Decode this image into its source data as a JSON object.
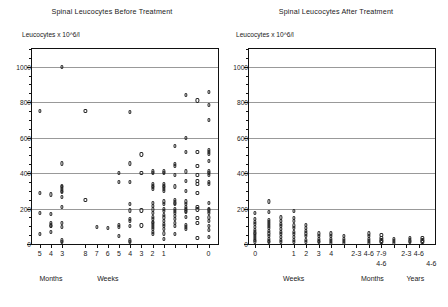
{
  "figure": {
    "panels": [
      {
        "id": "before",
        "title": "Spinal Leucocytes Before Treatment",
        "ylabel": "Leucocytes x 10^6/l",
        "xgroups": [
          {
            "label": "Months",
            "center_value": 4
          },
          {
            "label": "Weeks",
            "center_value": 6.5
          }
        ]
      },
      {
        "id": "after",
        "title": "Spinal Leucocytes After Treatment",
        "ylabel": "Leucocytes x 10^6/l",
        "xgroups": [
          {
            "label": "Weeks",
            "center_value": 2
          },
          {
            "label": "Months",
            "center_value": 6.5
          },
          {
            "label": "Years",
            "center_value": 9.0
          }
        ]
      }
    ]
  },
  "chart_data": [
    {
      "type": "scatter",
      "title": "Spinal Leucocytes Before Treatment",
      "xlabel": "Time before treatment (Months / Weeks)",
      "ylabel": "Leucocytes x 10^6/l",
      "ylim": [
        0,
        1100
      ],
      "yticks": [
        0,
        200,
        400,
        600,
        800,
        1000
      ],
      "grid": true,
      "legend": "none",
      "xticklabels": [
        "5",
        "4",
        "3",
        "8",
        "7",
        "6",
        "5",
        "4",
        "3",
        "2",
        "1",
        "",
        "",
        "",
        "0"
      ],
      "xtickvalues": [
        0.45,
        1.1,
        1.75,
        3.1,
        3.75,
        4.4,
        5.05,
        5.7,
        6.35,
        7.0,
        7.65,
        8.3,
        8.95,
        9.6,
        10.25
      ],
      "xlim": [
        0,
        10.8
      ],
      "points": [
        {
          "x": 0.45,
          "y": 750
        },
        {
          "x": 0.45,
          "y": 290
        },
        {
          "x": 0.45,
          "y": 175
        },
        {
          "x": 0.45,
          "y": 55
        },
        {
          "x": 1.1,
          "y": 280
        },
        {
          "x": 1.1,
          "y": 170
        },
        {
          "x": 1.1,
          "y": 120
        },
        {
          "x": 1.1,
          "y": 105
        },
        {
          "x": 1.1,
          "y": 100
        },
        {
          "x": 1.1,
          "y": 70
        },
        {
          "x": 1.75,
          "y": 1000
        },
        {
          "x": 1.75,
          "y": 455
        },
        {
          "x": 1.75,
          "y": 330
        },
        {
          "x": 1.75,
          "y": 320
        },
        {
          "x": 1.75,
          "y": 310
        },
        {
          "x": 1.75,
          "y": 300
        },
        {
          "x": 1.75,
          "y": 295
        },
        {
          "x": 1.75,
          "y": 265
        },
        {
          "x": 1.75,
          "y": 210
        },
        {
          "x": 1.75,
          "y": 120
        },
        {
          "x": 1.75,
          "y": 95
        },
        {
          "x": 1.75,
          "y": 20
        },
        {
          "x": 1.75,
          "y": 10
        },
        {
          "x": 3.1,
          "y": 750
        },
        {
          "x": 3.1,
          "y": 250
        },
        {
          "x": 3.75,
          "y": 95
        },
        {
          "x": 4.4,
          "y": 90
        },
        {
          "x": 5.05,
          "y": 400
        },
        {
          "x": 5.05,
          "y": 350
        },
        {
          "x": 5.05,
          "y": 110
        },
        {
          "x": 5.05,
          "y": 95
        },
        {
          "x": 5.05,
          "y": 45
        },
        {
          "x": 5.7,
          "y": 745
        },
        {
          "x": 5.7,
          "y": 455
        },
        {
          "x": 5.7,
          "y": 350
        },
        {
          "x": 5.7,
          "y": 225
        },
        {
          "x": 5.7,
          "y": 190
        },
        {
          "x": 5.7,
          "y": 140
        },
        {
          "x": 5.7,
          "y": 130
        },
        {
          "x": 5.7,
          "y": 100
        },
        {
          "x": 5.7,
          "y": 20
        },
        {
          "x": 5.7,
          "y": 12
        },
        {
          "x": 6.35,
          "y": 505
        },
        {
          "x": 6.35,
          "y": 400
        },
        {
          "x": 6.35,
          "y": 190
        },
        {
          "x": 6.35,
          "y": 105
        },
        {
          "x": 7.0,
          "y": 410
        },
        {
          "x": 7.0,
          "y": 400
        },
        {
          "x": 7.0,
          "y": 340
        },
        {
          "x": 7.0,
          "y": 330
        },
        {
          "x": 7.0,
          "y": 320
        },
        {
          "x": 7.0,
          "y": 310
        },
        {
          "x": 7.0,
          "y": 230
        },
        {
          "x": 7.0,
          "y": 215
        },
        {
          "x": 7.0,
          "y": 195
        },
        {
          "x": 7.0,
          "y": 175
        },
        {
          "x": 7.0,
          "y": 155
        },
        {
          "x": 7.0,
          "y": 140
        },
        {
          "x": 7.0,
          "y": 125
        },
        {
          "x": 7.0,
          "y": 120
        },
        {
          "x": 7.0,
          "y": 110
        },
        {
          "x": 7.0,
          "y": 95
        },
        {
          "x": 7.0,
          "y": 85
        },
        {
          "x": 7.0,
          "y": 70
        },
        {
          "x": 7.0,
          "y": 55
        },
        {
          "x": 7.65,
          "y": 410
        },
        {
          "x": 7.65,
          "y": 400
        },
        {
          "x": 7.65,
          "y": 340
        },
        {
          "x": 7.65,
          "y": 330
        },
        {
          "x": 7.65,
          "y": 320
        },
        {
          "x": 7.65,
          "y": 310
        },
        {
          "x": 7.65,
          "y": 300
        },
        {
          "x": 7.65,
          "y": 240
        },
        {
          "x": 7.65,
          "y": 225
        },
        {
          "x": 7.65,
          "y": 200
        },
        {
          "x": 7.65,
          "y": 185
        },
        {
          "x": 7.65,
          "y": 165
        },
        {
          "x": 7.65,
          "y": 150
        },
        {
          "x": 7.65,
          "y": 130
        },
        {
          "x": 7.65,
          "y": 115
        },
        {
          "x": 7.65,
          "y": 100
        },
        {
          "x": 7.65,
          "y": 85
        },
        {
          "x": 7.65,
          "y": 60
        },
        {
          "x": 7.65,
          "y": 30
        },
        {
          "x": 8.3,
          "y": 555
        },
        {
          "x": 8.3,
          "y": 450
        },
        {
          "x": 8.3,
          "y": 440
        },
        {
          "x": 8.3,
          "y": 390
        },
        {
          "x": 8.3,
          "y": 325
        },
        {
          "x": 8.3,
          "y": 250
        },
        {
          "x": 8.3,
          "y": 235
        },
        {
          "x": 8.3,
          "y": 225
        },
        {
          "x": 8.3,
          "y": 200
        },
        {
          "x": 8.3,
          "y": 185
        },
        {
          "x": 8.3,
          "y": 175
        },
        {
          "x": 8.3,
          "y": 160
        },
        {
          "x": 8.3,
          "y": 140
        },
        {
          "x": 8.3,
          "y": 120
        },
        {
          "x": 8.3,
          "y": 100
        },
        {
          "x": 8.3,
          "y": 55
        },
        {
          "x": 8.95,
          "y": 840
        },
        {
          "x": 8.95,
          "y": 600
        },
        {
          "x": 8.95,
          "y": 520
        },
        {
          "x": 8.95,
          "y": 410
        },
        {
          "x": 8.95,
          "y": 355
        },
        {
          "x": 8.95,
          "y": 300
        },
        {
          "x": 8.95,
          "y": 240
        },
        {
          "x": 8.95,
          "y": 225
        },
        {
          "x": 8.95,
          "y": 210
        },
        {
          "x": 8.95,
          "y": 200
        },
        {
          "x": 8.95,
          "y": 190
        },
        {
          "x": 8.95,
          "y": 180
        },
        {
          "x": 8.95,
          "y": 155
        },
        {
          "x": 8.95,
          "y": 110
        },
        {
          "x": 8.95,
          "y": 95
        },
        {
          "x": 8.95,
          "y": 85
        },
        {
          "x": 9.6,
          "y": 810
        },
        {
          "x": 9.6,
          "y": 520
        },
        {
          "x": 9.6,
          "y": 440
        },
        {
          "x": 9.6,
          "y": 390
        },
        {
          "x": 9.6,
          "y": 355
        },
        {
          "x": 9.6,
          "y": 340
        },
        {
          "x": 9.6,
          "y": 290
        },
        {
          "x": 9.6,
          "y": 210
        },
        {
          "x": 9.6,
          "y": 195
        },
        {
          "x": 9.6,
          "y": 145
        },
        {
          "x": 9.6,
          "y": 120
        },
        {
          "x": 9.6,
          "y": 35
        },
        {
          "x": 10.25,
          "y": 860
        },
        {
          "x": 10.25,
          "y": 785
        },
        {
          "x": 10.25,
          "y": 700
        },
        {
          "x": 10.25,
          "y": 530
        },
        {
          "x": 10.25,
          "y": 520
        },
        {
          "x": 10.25,
          "y": 510
        },
        {
          "x": 10.25,
          "y": 470
        },
        {
          "x": 10.25,
          "y": 410
        },
        {
          "x": 10.25,
          "y": 400
        },
        {
          "x": 10.25,
          "y": 390
        },
        {
          "x": 10.25,
          "y": 350
        },
        {
          "x": 10.25,
          "y": 340
        },
        {
          "x": 10.25,
          "y": 230
        },
        {
          "x": 10.25,
          "y": 200
        },
        {
          "x": 10.25,
          "y": 190
        },
        {
          "x": 10.25,
          "y": 175
        },
        {
          "x": 10.25,
          "y": 150
        },
        {
          "x": 10.25,
          "y": 130
        },
        {
          "x": 10.25,
          "y": 100
        },
        {
          "x": 10.25,
          "y": 80
        },
        {
          "x": 10.25,
          "y": 40
        }
      ]
    },
    {
      "type": "scatter",
      "title": "Spinal Leucocytes After Treatment",
      "xlabel": "Time after treatment (Weeks / Months / Years)",
      "ylabel": "Leucocytes x 10^6/l",
      "ylim": [
        0,
        1100
      ],
      "yticks": [
        0,
        200,
        400,
        600,
        800,
        1000
      ],
      "grid": true,
      "legend": "none",
      "xticklabels": [
        "0",
        "",
        "",
        "1",
        "2",
        "3",
        "4",
        "",
        "2-3",
        "4-6",
        "7-9",
        "",
        "2-3",
        "4-6"
      ],
      "xtickvalues": [
        0.35,
        1.1,
        1.8,
        2.5,
        3.2,
        3.9,
        4.6,
        5.3,
        6.0,
        6.7,
        7.4,
        8.1,
        8.8,
        9.5
      ],
      "xlim": [
        0,
        10.4
      ],
      "points": [
        {
          "x": 0.35,
          "y": 175
        },
        {
          "x": 0.35,
          "y": 140
        },
        {
          "x": 0.35,
          "y": 125
        },
        {
          "x": 0.35,
          "y": 115
        },
        {
          "x": 0.35,
          "y": 95
        },
        {
          "x": 0.35,
          "y": 80
        },
        {
          "x": 0.35,
          "y": 65
        },
        {
          "x": 0.35,
          "y": 55
        },
        {
          "x": 0.35,
          "y": 45
        },
        {
          "x": 0.35,
          "y": 35
        },
        {
          "x": 0.35,
          "y": 25
        },
        {
          "x": 0.35,
          "y": 15
        },
        {
          "x": 1.1,
          "y": 240
        },
        {
          "x": 1.1,
          "y": 180
        },
        {
          "x": 1.1,
          "y": 135
        },
        {
          "x": 1.1,
          "y": 125
        },
        {
          "x": 1.1,
          "y": 115
        },
        {
          "x": 1.1,
          "y": 100
        },
        {
          "x": 1.1,
          "y": 90
        },
        {
          "x": 1.1,
          "y": 75
        },
        {
          "x": 1.1,
          "y": 60
        },
        {
          "x": 1.1,
          "y": 45
        },
        {
          "x": 1.1,
          "y": 30
        },
        {
          "x": 1.1,
          "y": 18
        },
        {
          "x": 1.1,
          "y": 10
        },
        {
          "x": 1.8,
          "y": 150
        },
        {
          "x": 1.8,
          "y": 130
        },
        {
          "x": 1.8,
          "y": 115
        },
        {
          "x": 1.8,
          "y": 100
        },
        {
          "x": 1.8,
          "y": 85
        },
        {
          "x": 1.8,
          "y": 70
        },
        {
          "x": 1.8,
          "y": 55
        },
        {
          "x": 1.8,
          "y": 40
        },
        {
          "x": 1.8,
          "y": 25
        },
        {
          "x": 1.8,
          "y": 12
        },
        {
          "x": 2.5,
          "y": 185
        },
        {
          "x": 2.5,
          "y": 145
        },
        {
          "x": 2.5,
          "y": 130
        },
        {
          "x": 2.5,
          "y": 105
        },
        {
          "x": 2.5,
          "y": 90
        },
        {
          "x": 2.5,
          "y": 70
        },
        {
          "x": 2.5,
          "y": 55
        },
        {
          "x": 2.5,
          "y": 40
        },
        {
          "x": 2.5,
          "y": 25
        },
        {
          "x": 2.5,
          "y": 12
        },
        {
          "x": 3.2,
          "y": 110
        },
        {
          "x": 3.2,
          "y": 90
        },
        {
          "x": 3.2,
          "y": 75
        },
        {
          "x": 3.2,
          "y": 60
        },
        {
          "x": 3.2,
          "y": 45
        },
        {
          "x": 3.2,
          "y": 25
        },
        {
          "x": 3.2,
          "y": 12
        },
        {
          "x": 3.9,
          "y": 60
        },
        {
          "x": 3.9,
          "y": 45
        },
        {
          "x": 3.9,
          "y": 30
        },
        {
          "x": 3.9,
          "y": 18
        },
        {
          "x": 3.9,
          "y": 10
        },
        {
          "x": 4.6,
          "y": 60
        },
        {
          "x": 4.6,
          "y": 45
        },
        {
          "x": 4.6,
          "y": 30
        },
        {
          "x": 4.6,
          "y": 18
        },
        {
          "x": 4.6,
          "y": 8
        },
        {
          "x": 5.3,
          "y": 45
        },
        {
          "x": 5.3,
          "y": 30
        },
        {
          "x": 5.3,
          "y": 18
        },
        {
          "x": 5.3,
          "y": 8
        },
        {
          "x": 6.7,
          "y": 60
        },
        {
          "x": 6.7,
          "y": 45
        },
        {
          "x": 6.7,
          "y": 30
        },
        {
          "x": 6.7,
          "y": 18
        },
        {
          "x": 6.7,
          "y": 8
        },
        {
          "x": 7.4,
          "y": 50
        },
        {
          "x": 7.4,
          "y": 35
        },
        {
          "x": 7.4,
          "y": 20
        },
        {
          "x": 7.4,
          "y": 10
        },
        {
          "x": 8.1,
          "y": 30
        },
        {
          "x": 8.1,
          "y": 18
        },
        {
          "x": 8.1,
          "y": 8
        },
        {
          "x": 9.0,
          "y": 35
        },
        {
          "x": 9.0,
          "y": 20
        },
        {
          "x": 9.0,
          "y": 10
        },
        {
          "x": 9.7,
          "y": 35
        },
        {
          "x": 9.7,
          "y": 20
        },
        {
          "x": 9.7,
          "y": 10
        }
      ]
    }
  ],
  "axis_group_labels": {
    "before": [
      {
        "text": "Months",
        "x": 1.1
      },
      {
        "text": "Weeks",
        "x": 4.4
      }
    ],
    "after": [
      {
        "text": "Weeks",
        "x": 2.5
      },
      {
        "text": "Months",
        "x": 6.9
      },
      {
        "text": "Years",
        "x": 9.3
      }
    ]
  },
  "second_row_labels": {
    "after": [
      {
        "text": "4-6",
        "x": 6.7
      },
      {
        "text": "4-6",
        "x": 9.5
      }
    ]
  }
}
